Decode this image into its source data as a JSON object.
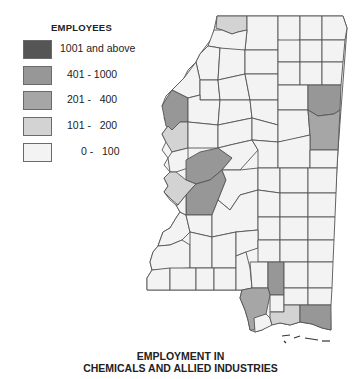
{
  "legend": {
    "title": "EMPLOYEES",
    "items": [
      {
        "label": "1001 and above",
        "color": "#555555"
      },
      {
        "label": "401 - 1000",
        "color": "#979797"
      },
      {
        "label": "201 -   400",
        "color": "#a6a6a6"
      },
      {
        "label": "101 -   200",
        "color": "#d3d3d3"
      },
      {
        "label": "0 -   100",
        "color": "#f3f3f3"
      }
    ]
  },
  "map": {
    "region": "Mississippi counties",
    "colors": {
      "class_1001_plus": "#555555",
      "class_401_1000": "#979797",
      "class_201_400": "#a6a6a6",
      "class_101_200": "#d3d3d3",
      "class_0_100": "#f3f3f3",
      "border": "#555555"
    }
  },
  "caption": {
    "line1": "EMPLOYMENT IN",
    "line2": "CHEMICALS AND ALLIED INDUSTRIES"
  }
}
